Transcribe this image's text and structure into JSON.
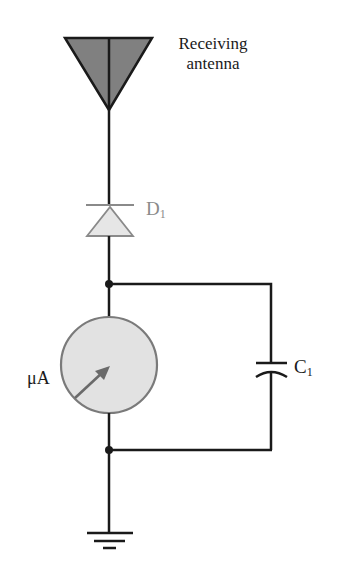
{
  "diagram": {
    "type": "circuit-schematic",
    "components": {
      "antenna": {
        "label_line1": "Receiving",
        "label_line2": "antenna",
        "fill": "#808080"
      },
      "diode": {
        "label": "D",
        "subscript": "1",
        "fill": "#e6e6e6",
        "stroke": "#8a8a8a"
      },
      "meter": {
        "label": "μA",
        "fill": "#e2e2e2",
        "stroke": "#7a7a7a"
      },
      "capacitor": {
        "label": "C",
        "subscript": "1"
      },
      "ground": {
        "label": ""
      }
    },
    "colors": {
      "wire": "#1a1a1a",
      "background": "#ffffff",
      "text": "#1a1a1a",
      "diode_text": "#8a8a8a"
    }
  }
}
